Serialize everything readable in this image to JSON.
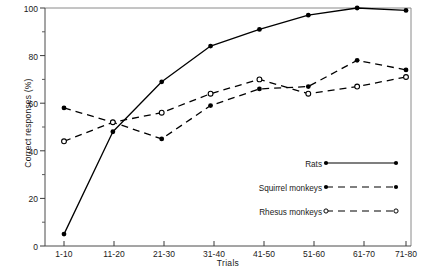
{
  "chart_data": {
    "type": "line",
    "title": "",
    "xlabel": "Trials",
    "ylabel": "Correct responses (%)",
    "categories": [
      "1-10",
      "11-20",
      "21-30",
      "31-40",
      "41-50",
      "51-60",
      "61-70",
      "71-80"
    ],
    "ylim": [
      0,
      100
    ],
    "ytick_labels": [
      "0",
      "20",
      "40",
      "60",
      "80",
      "100"
    ],
    "yticks_major": [
      0,
      20,
      40,
      60,
      80,
      100
    ],
    "yticks_minor": [
      10,
      30,
      50,
      70,
      90
    ],
    "grid": false,
    "legend_position": "inside-lower-right",
    "series": [
      {
        "name": "Rats",
        "line_style": "solid",
        "marker": "filled-circle",
        "color": "#000000",
        "values": [
          5,
          48,
          69,
          84,
          91,
          97,
          100,
          99
        ]
      },
      {
        "name": "Squirrel monkeys",
        "line_style": "dashed",
        "marker": "filled-circle",
        "color": "#000000",
        "values": [
          58,
          52,
          45,
          59,
          66,
          67,
          78,
          74
        ]
      },
      {
        "name": "Rhesus monkeys",
        "line_style": "dashed",
        "marker": "open-circle",
        "color": "#000000",
        "values": [
          44,
          52,
          56,
          64,
          70,
          64,
          67,
          71
        ]
      }
    ]
  },
  "axes": {
    "x_axis_title": "Trials",
    "y_axis_title": "Correct responses (%)"
  },
  "legend": {
    "entries": [
      {
        "label": "Rats"
      },
      {
        "label": "Squirrel monkeys"
      },
      {
        "label": "Rhesus monkeys"
      }
    ]
  },
  "style": {
    "foreground": "#000000",
    "axis_color": "#6e6e6e",
    "background": "#ffffff"
  }
}
